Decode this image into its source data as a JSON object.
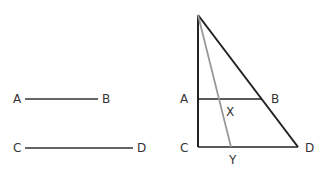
{
  "left_figure": {
    "segment_ab": {
      "start_label": "A",
      "end_label": "B"
    },
    "segment_cd": {
      "start_label": "C",
      "end_label": "D"
    }
  },
  "right_figure": {
    "labels": {
      "a": "A",
      "b": "B",
      "c": "C",
      "d": "D",
      "x": "X",
      "y": "Y"
    },
    "colors": {
      "triangle": "#222222",
      "median": "#999999"
    }
  }
}
